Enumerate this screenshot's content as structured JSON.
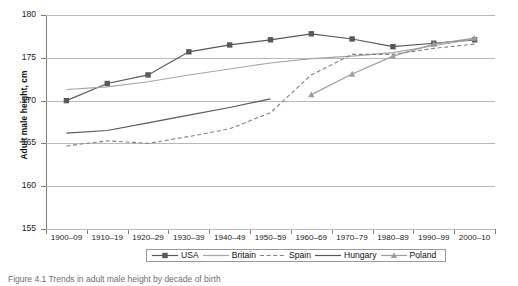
{
  "figure": {
    "caption": "Figure 4.1  Trends in adult male height by decade of birth",
    "y_axis_title": "Adult male height, cm"
  },
  "chart_data": {
    "type": "line",
    "title": "",
    "xlabel": "",
    "ylabel": "Adult male height, cm",
    "ylim": [
      155,
      180
    ],
    "ytick_labels": [
      "180",
      "175",
      "170",
      "165",
      "160",
      "155"
    ],
    "yticks": [
      180,
      175,
      170,
      165,
      160,
      155
    ],
    "grid": true,
    "legend_position": "bottom-center",
    "categories": [
      "1900–09",
      "1910–19",
      "1920–29",
      "1930–39",
      "1940–49",
      "1950–59",
      "1960–69",
      "1970–79",
      "1980–89",
      "1990–99",
      "2000–10"
    ],
    "series": [
      {
        "name": "USA",
        "color": "#595959",
        "marker": "square",
        "dash": "solid",
        "values": [
          170.0,
          172.0,
          173.0,
          175.7,
          176.5,
          177.1,
          177.8,
          177.2,
          176.3,
          176.7,
          177.1
        ]
      },
      {
        "name": "Britain",
        "color": "#a6a6a6",
        "marker": "none",
        "dash": "solid",
        "values": [
          171.3,
          171.6,
          172.2,
          173.0,
          173.7,
          174.4,
          174.9,
          175.2,
          175.6,
          176.4,
          177.2
        ]
      },
      {
        "name": "Spain",
        "color": "#808080",
        "marker": "none",
        "dash": "dashed",
        "values": [
          164.7,
          165.3,
          165.0,
          165.8,
          166.7,
          168.6,
          173.0,
          175.4,
          175.4,
          176.1,
          176.6
        ]
      },
      {
        "name": "Hungary",
        "color": "#595959",
        "marker": "none",
        "dash": "solid",
        "values": [
          166.2,
          166.5,
          167.4,
          168.3,
          169.2,
          170.2,
          null,
          null,
          null,
          null,
          null
        ]
      },
      {
        "name": "Poland",
        "color": "#9e9e9e",
        "marker": "triangle",
        "dash": "solid",
        "values": [
          null,
          null,
          null,
          null,
          null,
          null,
          170.7,
          173.1,
          175.2,
          176.6,
          177.3
        ]
      }
    ]
  }
}
